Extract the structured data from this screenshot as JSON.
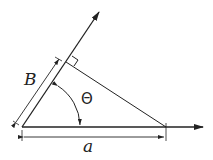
{
  "diagram": {
    "title": "",
    "labels": {
      "side_b": "B",
      "side_a": "a",
      "angle": "Θ"
    },
    "elements": [
      "horizontal ray with arrow",
      "inclined ray with arrow",
      "perpendicular from end of a onto inclined ray",
      "right-angle marker",
      "dimension line for B along inclined ray",
      "dimension line for a below horizontal ray",
      "angle arc Θ with arrowheads"
    ],
    "colors": {
      "stroke": "#222222",
      "background": "#ffffff"
    }
  }
}
